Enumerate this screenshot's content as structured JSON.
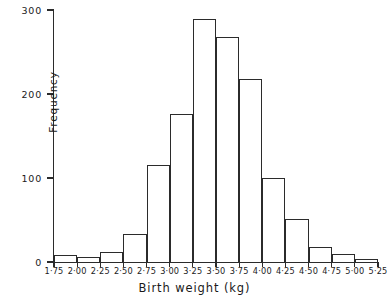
{
  "chart_data": {
    "type": "bar",
    "title": "",
    "subtitle": "",
    "xlabel": "Birth weight (kg)",
    "ylabel": "Frequency",
    "grid": false,
    "legend": false,
    "legend_position": "none",
    "xlim": [
      1.75,
      5.25
    ],
    "ylim": [
      0,
      300
    ],
    "yticks": [
      0,
      100,
      200,
      300
    ],
    "ytick_labels": [
      "0",
      "100",
      "200",
      "300"
    ],
    "bin_edges": [
      1.75,
      2.0,
      2.25,
      2.5,
      2.75,
      3.0,
      3.25,
      3.5,
      3.75,
      4.0,
      4.25,
      4.5,
      4.75,
      5.0,
      5.25
    ],
    "xtick_labels": [
      "1·75",
      "2·00",
      "2·25",
      "2·50",
      "2·75",
      "3·00",
      "3·25",
      "3·50",
      "3·75",
      "4·00",
      "4·25",
      "4·50",
      "4·75",
      "5·00",
      "5·25"
    ],
    "categories": [
      "1·75–2·00",
      "2·00–2·25",
      "2·25–2·50",
      "2·50–2·75",
      "2·75–3·00",
      "3·00–3·25",
      "3·25–3·50",
      "3·50–3·75",
      "3·75–4·00",
      "4·00–4·25",
      "4·25–4·50",
      "4·50–4·75",
      "4·75–5·00",
      "5·00–5·25"
    ],
    "values": [
      8,
      6,
      12,
      33,
      116,
      176,
      289,
      268,
      218,
      100,
      51,
      18,
      10,
      4
    ],
    "colors": {
      "line": "#2b2b2b",
      "fill": "transparent",
      "text": "#1a1a1a",
      "background": "#ffffff"
    }
  }
}
